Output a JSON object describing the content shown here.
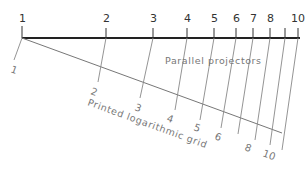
{
  "diagram": {
    "top_scale": {
      "labels": [
        "1",
        "2",
        "3",
        "4",
        "5",
        "6",
        "7",
        "8",
        "10"
      ],
      "tick_x": [
        22,
        106,
        153,
        187,
        214,
        236,
        253,
        270,
        285,
        298
      ]
    },
    "bottom_scale": {
      "labels": [
        "1",
        "2",
        "3",
        "4",
        "5",
        "6",
        "8",
        "10"
      ]
    },
    "captions": {
      "projectors": "Parallel projectors",
      "grid": "Printed logarithmic grid"
    },
    "colors": {
      "main_line": "#222222",
      "projector_line": "#777777",
      "text": "#666666"
    }
  }
}
